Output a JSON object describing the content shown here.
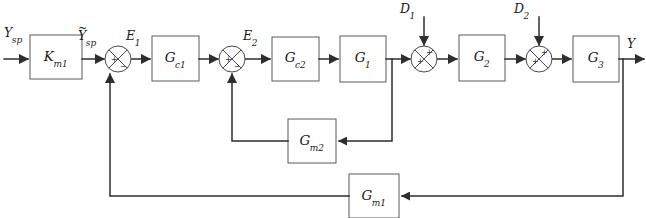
{
  "diagram": {
    "type": "block-diagram",
    "canvas": {
      "width": 646,
      "height": 218
    },
    "colors": {
      "line": "#2e2e2e",
      "block_stroke": "#5a5a5a",
      "block_fill": "#ffffff",
      "background": "#ffffff",
      "text": "#1a1a1a"
    }
  },
  "blocks": [
    {
      "id": "km1",
      "label": "K",
      "sub": "m1",
      "x": 30,
      "y": 35,
      "w": 52,
      "h": 44
    },
    {
      "id": "gc1",
      "label": "G",
      "sub": "c1",
      "x": 152,
      "y": 36,
      "w": 47,
      "h": 45
    },
    {
      "id": "gc2",
      "label": "G",
      "sub": "c2",
      "x": 272,
      "y": 37,
      "w": 47,
      "h": 44
    },
    {
      "id": "g1",
      "label": "G",
      "sub": "1",
      "x": 340,
      "y": 36,
      "w": 46,
      "h": 46
    },
    {
      "id": "g2",
      "label": "G",
      "sub": "2",
      "x": 459,
      "y": 35,
      "w": 46,
      "h": 46
    },
    {
      "id": "g3",
      "label": "G",
      "sub": "3",
      "x": 573,
      "y": 36,
      "w": 46,
      "h": 46
    },
    {
      "id": "gm2",
      "label": "G",
      "sub": "m2",
      "x": 288,
      "y": 119,
      "w": 48,
      "h": 44
    },
    {
      "id": "gm1",
      "label": "G",
      "sub": "m1",
      "x": 349,
      "y": 174,
      "w": 50,
      "h": 44
    }
  ],
  "summing_junctions": [
    {
      "id": "sum1",
      "cx": 118,
      "cy": 59,
      "r": 13,
      "signs": {
        "left": "+",
        "bottom": "−"
      }
    },
    {
      "id": "sum2",
      "cx": 232,
      "cy": 59,
      "r": 13,
      "signs": {
        "left": "+",
        "bottom": "−"
      }
    },
    {
      "id": "sum3",
      "cx": 424,
      "cy": 59,
      "r": 13,
      "signs": {
        "left": "+",
        "top": "+"
      }
    },
    {
      "id": "sum4",
      "cx": 539,
      "cy": 59,
      "r": 13,
      "signs": {
        "left": "+",
        "top": "+"
      }
    }
  ],
  "signal_labels": [
    {
      "id": "ysp",
      "text": "Y",
      "sub": "sp",
      "tilde": false,
      "x": 4,
      "y": 27
    },
    {
      "id": "ysp_meas",
      "text": "Y",
      "sub": "sp",
      "tilde": true,
      "x": 78,
      "y": 30
    },
    {
      "id": "e1",
      "text": "E",
      "sub": "1",
      "tilde": false,
      "x": 126,
      "y": 30
    },
    {
      "id": "e2",
      "text": "E",
      "sub": "2",
      "tilde": false,
      "x": 243,
      "y": 30
    },
    {
      "id": "d1",
      "text": "D",
      "sub": "1",
      "tilde": false,
      "x": 400,
      "y": 3
    },
    {
      "id": "d2",
      "text": "D",
      "sub": "2",
      "tilde": false,
      "x": 514,
      "y": 3
    },
    {
      "id": "y_out",
      "text": "Y",
      "sub": "",
      "tilde": false,
      "x": 627,
      "y": 38
    }
  ],
  "connections": [
    {
      "id": "in-to-km1",
      "from": "input",
      "to": "km1",
      "arrow": true
    },
    {
      "id": "km1-to-sum1",
      "from": "km1",
      "to": "sum1",
      "arrow": true
    },
    {
      "id": "sum1-to-gc1",
      "from": "sum1",
      "to": "gc1",
      "arrow": true
    },
    {
      "id": "gc1-to-sum2",
      "from": "gc1",
      "to": "sum2",
      "arrow": true
    },
    {
      "id": "sum2-to-gc2",
      "from": "sum2",
      "to": "gc2",
      "arrow": true
    },
    {
      "id": "gc2-to-g1",
      "from": "gc2",
      "to": "g1",
      "arrow": true
    },
    {
      "id": "g1-to-sum3",
      "from": "g1",
      "to": "sum3",
      "arrow": true
    },
    {
      "id": "d1-to-sum3",
      "from": "d1",
      "to": "sum3",
      "arrow": true
    },
    {
      "id": "sum3-to-g2",
      "from": "sum3",
      "to": "g2",
      "arrow": true
    },
    {
      "id": "g2-to-sum4",
      "from": "g2",
      "to": "sum4",
      "arrow": true
    },
    {
      "id": "d2-to-sum4",
      "from": "d2",
      "to": "sum4",
      "arrow": true
    },
    {
      "id": "sum4-to-g3",
      "from": "sum4",
      "to": "g3",
      "arrow": true
    },
    {
      "id": "g3-to-output",
      "from": "g3",
      "to": "output",
      "arrow": true
    },
    {
      "id": "inner-tap-to-gm2",
      "from": "g1-out",
      "to": "gm2",
      "arrow": true
    },
    {
      "id": "gm2-to-sum2",
      "from": "gm2",
      "to": "sum2",
      "arrow": true
    },
    {
      "id": "outer-tap-to-gm1",
      "from": "g3-out",
      "to": "gm1",
      "arrow": true
    },
    {
      "id": "gm1-to-sum1",
      "from": "gm1",
      "to": "sum1",
      "arrow": true
    }
  ]
}
